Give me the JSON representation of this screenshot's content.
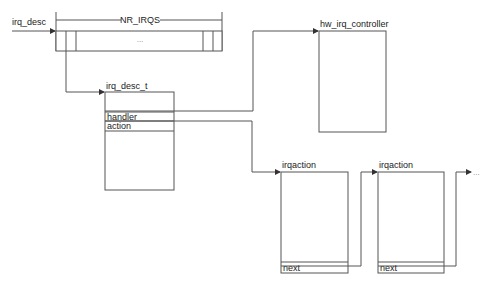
{
  "diagram": {
    "type": "linux-irq-data-structures",
    "array": {
      "pointer_label": "irq_desc",
      "size_label": "NR_IRQS",
      "ellipsis": "..."
    },
    "irq_desc_t": {
      "title": "irq_desc_t",
      "fields": [
        "handler",
        "action"
      ]
    },
    "hw_irq_controller": {
      "title": "hw_irq_controller"
    },
    "irqactions": [
      {
        "title": "irqaction",
        "field": "next"
      },
      {
        "title": "irqaction",
        "field": "next"
      }
    ],
    "continuation": "...",
    "colors": {
      "stroke": "#555555",
      "text": "#222222",
      "background": "#ffffff"
    }
  }
}
